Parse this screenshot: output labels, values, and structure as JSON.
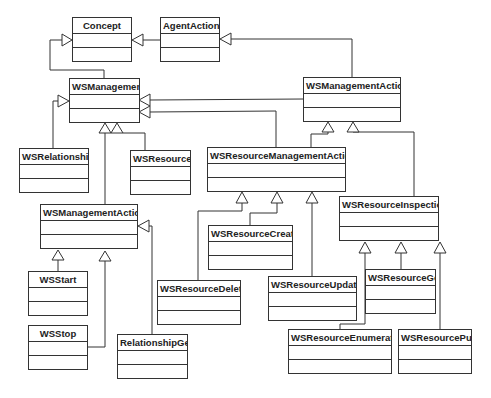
{
  "diagram": {
    "type": "UML class diagram",
    "classes": [
      {
        "id": "concept",
        "name": "Concept",
        "x": 72,
        "y": 17,
        "w": 60,
        "h": 45,
        "center": true
      },
      {
        "id": "agentaction",
        "name": "AgentAction",
        "x": 160,
        "y": 17,
        "w": 60,
        "h": 45,
        "center": true
      },
      {
        "id": "wsmanagement",
        "name": "WSManagement",
        "x": 69,
        "y": 78,
        "w": 71,
        "h": 45,
        "center": false
      },
      {
        "id": "wsmanagementaction-top",
        "name": "WSManagementAction",
        "x": 303,
        "y": 77,
        "w": 98,
        "h": 45,
        "center": false
      },
      {
        "id": "wsrelationship",
        "name": "WSRelationship",
        "x": 19,
        "y": 148,
        "w": 70,
        "h": 45,
        "center": false
      },
      {
        "id": "wsresource",
        "name": "WSResource",
        "x": 130,
        "y": 150,
        "w": 61,
        "h": 45,
        "center": false
      },
      {
        "id": "wsresourcemanagementaction",
        "name": "WSResourceManagementAction",
        "x": 207,
        "y": 147,
        "w": 139,
        "h": 45,
        "center": false
      },
      {
        "id": "wsmanagementaction-lower",
        "name": "WSManagementAction",
        "x": 40,
        "y": 204,
        "w": 98,
        "h": 45,
        "center": false
      },
      {
        "id": "wsresourceinspection",
        "name": "WSResourceInspection",
        "x": 339,
        "y": 196,
        "w": 100,
        "h": 45,
        "center": false
      },
      {
        "id": "wsresourcecreate",
        "name": "WSResourceCreate",
        "x": 208,
        "y": 225,
        "w": 85,
        "h": 45,
        "center": false
      },
      {
        "id": "wsstart",
        "name": "WSStart",
        "x": 28,
        "y": 271,
        "w": 60,
        "h": 45,
        "center": true
      },
      {
        "id": "wsresourceupdate",
        "name": "WSResourceUpdate",
        "x": 268,
        "y": 276,
        "w": 89,
        "h": 45,
        "center": false
      },
      {
        "id": "wsresourceget",
        "name": "WSResourceGet",
        "x": 365,
        "y": 269,
        "w": 71,
        "h": 45,
        "center": false
      },
      {
        "id": "wsresourcedelete",
        "name": "WSResourceDelete",
        "x": 157,
        "y": 280,
        "w": 84,
        "h": 45,
        "center": false
      },
      {
        "id": "wsstop",
        "name": "WSStop",
        "x": 28,
        "y": 325,
        "w": 60,
        "h": 45,
        "center": true
      },
      {
        "id": "relationshipget",
        "name": "RelationshipGet",
        "x": 117,
        "y": 334,
        "w": 71,
        "h": 45,
        "center": false
      },
      {
        "id": "wsresourceenumerate",
        "name": "WSResourceEnumerate",
        "x": 288,
        "y": 329,
        "w": 104,
        "h": 45,
        "center": false
      },
      {
        "id": "wsresourcepull",
        "name": "WSResourcePull",
        "x": 398,
        "y": 329,
        "w": 74,
        "h": 45,
        "center": false
      }
    ],
    "generalizations": [
      {
        "from": "WSManagement",
        "to": "Concept"
      },
      {
        "from": "AgentAction",
        "to": "Concept"
      },
      {
        "from": "WSManagementAction",
        "to": "AgentAction"
      },
      {
        "from": "WSManagementAction",
        "to": "WSManagement"
      },
      {
        "from": "WSResourceManagementAction",
        "to": "WSManagement"
      },
      {
        "from": "WSRelationship",
        "to": "WSManagement"
      },
      {
        "from": "WSResource",
        "to": "WSManagement"
      },
      {
        "from": "WSManagementAction (lower)",
        "to": "WSManagement"
      },
      {
        "from": "WSResourceManagementAction",
        "to": "WSManagementAction"
      },
      {
        "from": "WSResourceInspection",
        "to": "WSManagementAction"
      },
      {
        "from": "WSStart",
        "to": "WSManagementAction (lower)"
      },
      {
        "from": "WSStop",
        "to": "WSManagementAction (lower)"
      },
      {
        "from": "RelationshipGet",
        "to": "WSManagementAction (lower)"
      },
      {
        "from": "WSResourceDelete",
        "to": "WSResourceManagementAction"
      },
      {
        "from": "WSResourceCreate",
        "to": "WSResourceManagementAction"
      },
      {
        "from": "WSResourceUpdate",
        "to": "WSResourceManagementAction"
      },
      {
        "from": "WSResourceEnumerate",
        "to": "WSResourceInspection"
      },
      {
        "from": "WSResourceGet",
        "to": "WSResourceInspection"
      },
      {
        "from": "WSResourcePull",
        "to": "WSResourceInspection"
      }
    ]
  },
  "colors": {
    "line": "#333333",
    "background": "#ffffff"
  }
}
